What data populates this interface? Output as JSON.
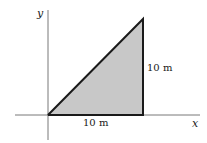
{
  "diagram": {
    "type": "right-triangle-area",
    "axes": {
      "x_label": "x",
      "y_label": "y"
    },
    "triangle": {
      "vertices": [
        [
          0,
          0
        ],
        [
          10,
          0
        ],
        [
          10,
          10
        ]
      ],
      "fill": "#c8c8c8",
      "stroke": "#1a1a1a"
    },
    "labels": {
      "base": "10 m",
      "height": "10 m"
    }
  }
}
